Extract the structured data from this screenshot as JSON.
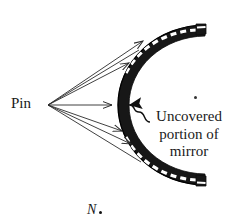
{
  "figure": {
    "caption_labels": {
      "pin": "Pin",
      "callout_line_1": "Uncovered",
      "callout_line_2": "portion of",
      "callout_line_3": "mirror",
      "point_n": "N"
    },
    "colors": {
      "ink": "#111111",
      "mirror_body": "#1a1a1a",
      "mirror_hatch": "#ffffff",
      "ray": "#2b2b2b",
      "background": "#ffffff"
    },
    "geometry": {
      "pin_point": [
        48,
        105
      ],
      "mirror_vertex": [
        118,
        105
      ],
      "mirror_top_end": [
        205,
        25
      ],
      "mirror_bottom_end": [
        205,
        185
      ],
      "uncovered_arrow_tip": [
        122,
        105
      ],
      "stray_dot": [
        195,
        97
      ],
      "n_dot": [
        100,
        212
      ]
    },
    "icon_names": {
      "mirror": "concave-mirror-arc",
      "rays": "light-ray-lines",
      "callout": "squiggle-leader-arrow",
      "pin_vertex": "pin-object-point"
    }
  }
}
